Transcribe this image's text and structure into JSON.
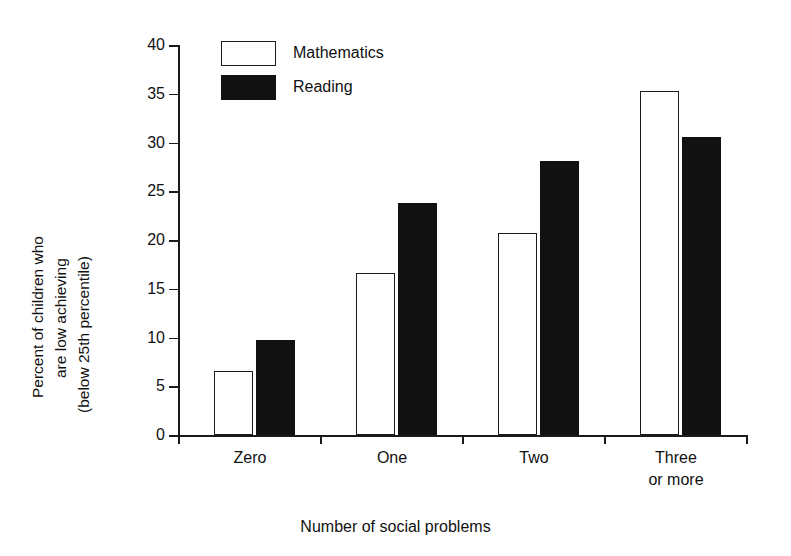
{
  "chart_data": {
    "type": "bar",
    "title": "",
    "xlabel": "Number of social problems",
    "ylabel": "Percent of children who are low achieving (below 25th percentile)",
    "ylabel_lines": [
      "Percent of children who",
      "are low achieving",
      "(below 25th percentile)"
    ],
    "categories": [
      "Zero",
      "One",
      "Two",
      "Three or more"
    ],
    "category_lines": [
      [
        "Zero"
      ],
      [
        "One"
      ],
      [
        "Two"
      ],
      [
        "Three",
        "or more"
      ]
    ],
    "series": [
      {
        "name": "Mathematics",
        "color": "#ffffff",
        "edge_color": "#1a1a1a",
        "values": [
          6.6,
          16.6,
          20.7,
          35.3
        ]
      },
      {
        "name": "Reading",
        "color": "#111111",
        "edge_color": "#111111",
        "values": [
          9.7,
          23.8,
          28.1,
          30.6
        ]
      }
    ],
    "ylim": [
      0,
      40
    ],
    "yticks": [
      0,
      5,
      10,
      15,
      20,
      25,
      30,
      35,
      40
    ],
    "ytick_labels": [
      "0",
      "5",
      "10",
      "15",
      "20",
      "25",
      "30",
      "35",
      "40"
    ],
    "grid": false,
    "legend_position": "top-left-inside"
  },
  "legend": {
    "items": [
      {
        "label": "Mathematics",
        "style": "outline"
      },
      {
        "label": "Reading",
        "style": "filled"
      }
    ]
  },
  "axes": {
    "x_title": "Number of social problems",
    "y_title_line1": "Percent of children who",
    "y_title_line2": "are low achieving",
    "y_title_line3": "(below 25th percentile)"
  }
}
